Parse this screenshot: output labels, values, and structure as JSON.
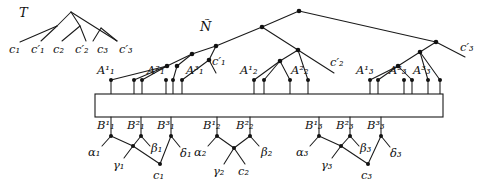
{
  "figure": {
    "caption_labels": {
      "tree_T": "T",
      "network_N": "Ñ"
    },
    "colors": {
      "ink": "#111111",
      "line": "#1a1a1a",
      "background": "#ffffff"
    }
  },
  "tree_T": {
    "name": "T",
    "label": "T",
    "leaves": [
      {
        "id": "c1",
        "base": "c",
        "sub": "1",
        "prime": false,
        "label": "c₁"
      },
      {
        "id": "c1p",
        "base": "c",
        "sub": "1",
        "prime": true,
        "label": "c′₁"
      },
      {
        "id": "c2",
        "base": "c",
        "sub": "2",
        "prime": false,
        "label": "c₂"
      },
      {
        "id": "c2p",
        "base": "c",
        "sub": "2",
        "prime": true,
        "label": "c′₂"
      },
      {
        "id": "c3",
        "base": "c",
        "sub": "3",
        "prime": false,
        "label": "c₃"
      },
      {
        "id": "c3p",
        "base": "c",
        "sub": "3",
        "prime": true,
        "label": "c′₃"
      }
    ]
  },
  "network_N": {
    "name": "N",
    "label": "Ñ",
    "reticulation_leaves": [
      {
        "id": "c1p",
        "base": "c",
        "sub": "1",
        "prime": true,
        "label": "c′₁"
      },
      {
        "id": "c2p",
        "base": "c",
        "sub": "2",
        "prime": true,
        "label": "c′₂"
      },
      {
        "id": "c3p",
        "base": "c",
        "sub": "3",
        "prime": true,
        "label": "c′₃"
      }
    ],
    "A_nodes": [
      {
        "id": "A1_1",
        "base": "A",
        "sup": "1",
        "sub": "1",
        "label": "A¹₁"
      },
      {
        "id": "A1_2",
        "base": "A",
        "sup": "2",
        "sub": "1",
        "label": "A²₁"
      },
      {
        "id": "A1_3",
        "base": "A",
        "sup": "3",
        "sub": "1",
        "label": "A³₁"
      },
      {
        "id": "A2_1",
        "base": "A",
        "sup": "1",
        "sub": "2",
        "label": "A¹₂"
      },
      {
        "id": "A2_2",
        "base": "A",
        "sup": "2",
        "sub": "2",
        "label": "A²₂"
      },
      {
        "id": "A3_1",
        "base": "A",
        "sup": "1",
        "sub": "3",
        "label": "A¹₃"
      },
      {
        "id": "A3_2",
        "base": "A",
        "sup": "2",
        "sub": "3",
        "label": "A²₃"
      },
      {
        "id": "A3_3",
        "base": "A",
        "sup": "3",
        "sub": "3",
        "label": "A³₃"
      }
    ]
  },
  "connector_box": {
    "name": "gadget-box",
    "label": ""
  },
  "gadgets": [
    {
      "id": "group1",
      "B_nodes": [
        {
          "id": "B1_1",
          "base": "B",
          "sup": "1",
          "sub": "1",
          "label": "B¹₁"
        },
        {
          "id": "B1_2",
          "base": "B",
          "sup": "2",
          "sub": "1",
          "label": "B²₁"
        },
        {
          "id": "B1_3",
          "base": "B",
          "sup": "3",
          "sub": "1",
          "label": "B³₁"
        }
      ],
      "greek_leaves": [
        {
          "id": "alpha1",
          "base": "α",
          "sub": "1",
          "label": "α₁"
        },
        {
          "id": "beta1",
          "base": "β",
          "sub": "1",
          "label": "β₁"
        },
        {
          "id": "gamma1",
          "base": "γ",
          "sub": "1",
          "label": "γ₁"
        },
        {
          "id": "delta1",
          "base": "δ",
          "sub": "1",
          "label": "δ₁"
        }
      ],
      "c_leaf": {
        "id": "c1",
        "base": "c",
        "sub": "1",
        "label": "c₁"
      }
    },
    {
      "id": "group2",
      "B_nodes": [
        {
          "id": "B2_1",
          "base": "B",
          "sup": "1",
          "sub": "2",
          "label": "B¹₂"
        },
        {
          "id": "B2_2",
          "base": "B",
          "sup": "2",
          "sub": "2",
          "label": "B²₂"
        }
      ],
      "greek_leaves": [
        {
          "id": "alpha2",
          "base": "α",
          "sub": "2",
          "label": "α₂"
        },
        {
          "id": "beta2",
          "base": "β",
          "sub": "2",
          "label": "β₂"
        },
        {
          "id": "gamma2",
          "base": "γ",
          "sub": "2",
          "label": "γ₂"
        }
      ],
      "c_leaf": {
        "id": "c2",
        "base": "c",
        "sub": "2",
        "label": "c₂"
      }
    },
    {
      "id": "group3",
      "B_nodes": [
        {
          "id": "B3_1",
          "base": "B",
          "sup": "1",
          "sub": "3",
          "label": "B¹₃"
        },
        {
          "id": "B3_2",
          "base": "B",
          "sup": "2",
          "sub": "3",
          "label": "B²₃"
        },
        {
          "id": "B3_3",
          "base": "B",
          "sup": "3",
          "sub": "3",
          "label": "B³₃"
        }
      ],
      "greek_leaves": [
        {
          "id": "alpha3",
          "base": "α",
          "sub": "3",
          "label": "α₃"
        },
        {
          "id": "beta3",
          "base": "β",
          "sub": "3",
          "label": "β₃"
        },
        {
          "id": "gamma3",
          "base": "γ",
          "sub": "3",
          "label": "γ₃"
        },
        {
          "id": "delta3",
          "base": "δ",
          "sub": "3",
          "label": "δ₃"
        }
      ],
      "c_leaf": {
        "id": "c3",
        "base": "c",
        "sub": "3",
        "label": "c₃"
      }
    }
  ]
}
